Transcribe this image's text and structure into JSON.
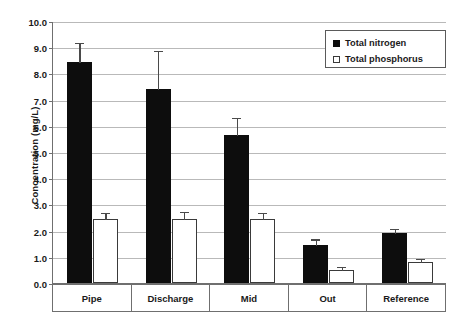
{
  "chart_data": {
    "type": "bar",
    "title": "",
    "xlabel": "",
    "ylabel": "Concentration (mg/L)",
    "ylim": [
      0,
      10
    ],
    "ytick_labels": [
      "0.0",
      "1.0",
      "2.0",
      "3.0",
      "4.0",
      "5.0",
      "6.0",
      "7.0",
      "8.0",
      "9.0",
      "10.0"
    ],
    "ytick_values": [
      0,
      1,
      2,
      3,
      4,
      5,
      6,
      7,
      8,
      9,
      10
    ],
    "grid": true,
    "legend_position": "top-right",
    "categories": [
      "Pipe",
      "Discharge",
      "Mid",
      "Out",
      "Reference"
    ],
    "series": [
      {
        "name": "Total nitrogen",
        "color": "#0d0d0d",
        "style": "filled",
        "values": [
          8.45,
          7.4,
          5.65,
          1.45,
          1.9
        ],
        "errors_upper": [
          0.75,
          1.5,
          0.7,
          0.25,
          0.2
        ]
      },
      {
        "name": "Total phosphorus",
        "color": "#ffffff",
        "style": "open",
        "values": [
          2.45,
          2.45,
          2.45,
          0.5,
          0.8
        ],
        "errors_upper": [
          0.25,
          0.3,
          0.25,
          0.15,
          0.15
        ]
      }
    ]
  },
  "legend": {
    "items": [
      {
        "label": "Total nitrogen",
        "swatch": "filled-square-icon"
      },
      {
        "label": "Total phosphorus",
        "swatch": "open-square-icon"
      }
    ]
  }
}
